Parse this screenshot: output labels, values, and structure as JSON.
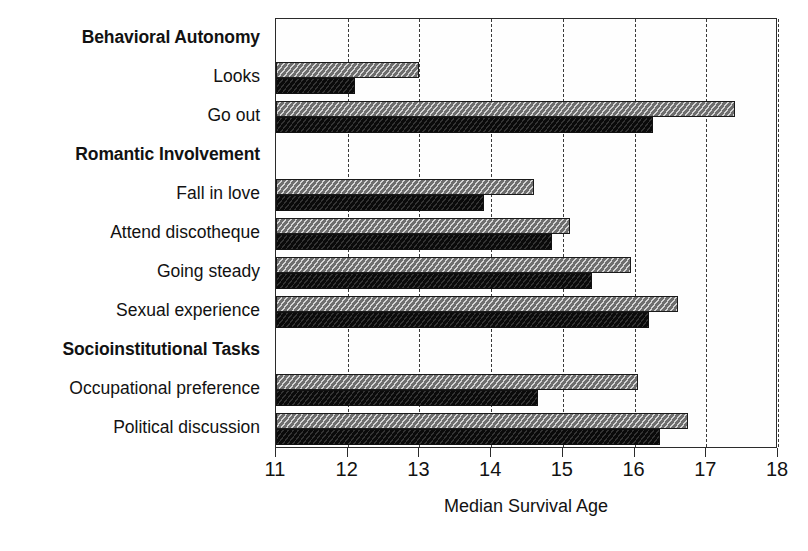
{
  "chart_data": {
    "type": "bar",
    "orientation": "horizontal",
    "title": "",
    "xlabel": "Median Survival Age",
    "ylabel": "",
    "xlim": [
      11,
      18
    ],
    "xticks": [
      11,
      12,
      13,
      14,
      15,
      16,
      17,
      18
    ],
    "grid": "vertical dashed gridlines at each integer tick",
    "legend": {
      "title": "Adversity",
      "position": "top-right inside plot",
      "entries": [
        {
          "label": "low",
          "swatch": "gray-hatched",
          "color": "#8f8f8f"
        },
        {
          "label": "high",
          "swatch": "black-solid",
          "color": "#151515"
        }
      ]
    },
    "series": [
      {
        "name": "low",
        "values": [
          null,
          13.0,
          17.4,
          null,
          14.6,
          15.1,
          15.95,
          16.6,
          null,
          16.05,
          16.75
        ]
      },
      {
        "name": "high",
        "values": [
          null,
          12.1,
          16.25,
          null,
          13.9,
          14.85,
          15.4,
          16.2,
          null,
          14.65,
          16.35
        ]
      }
    ],
    "categories": [
      {
        "label": "Behavioral Autonomy",
        "is_group_header": true
      },
      {
        "label": "Looks",
        "is_group_header": false,
        "low": 13.0,
        "high": 12.1
      },
      {
        "label": "Go out",
        "is_group_header": false,
        "low": 17.4,
        "high": 16.25
      },
      {
        "label": "Romantic Involvement",
        "is_group_header": true
      },
      {
        "label": "Fall in love",
        "is_group_header": false,
        "low": 14.6,
        "high": 13.9
      },
      {
        "label": "Attend discotheque",
        "is_group_header": false,
        "low": 15.1,
        "high": 14.85
      },
      {
        "label": "Going steady",
        "is_group_header": false,
        "low": 15.95,
        "high": 15.4
      },
      {
        "label": "Sexual experience",
        "is_group_header": false,
        "low": 16.6,
        "high": 16.2
      },
      {
        "label": "Socioinstitutional Tasks",
        "is_group_header": true
      },
      {
        "label": "Occupational preference",
        "is_group_header": false,
        "low": 16.05,
        "high": 14.65
      },
      {
        "label": "Political discussion",
        "is_group_header": false,
        "low": 16.75,
        "high": 16.35
      }
    ]
  }
}
